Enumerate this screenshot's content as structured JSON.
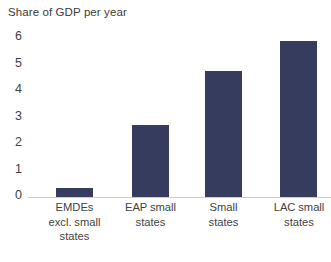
{
  "chart_data": {
    "type": "bar",
    "title": "Share of GDP per year",
    "xlabel": "",
    "ylabel": "",
    "ylim": [
      0,
      6
    ],
    "grid": false,
    "legend": false,
    "y_ticks": [
      "6",
      "5",
      "4",
      "3",
      "2",
      "1",
      "0"
    ],
    "bar_color": "#353c5e",
    "axis_color": "#c9ccd4",
    "text_color": "#3f3f3f",
    "categories": [
      "EMDEs excl. small states",
      "EAP small states",
      "Small states",
      "LAC small states"
    ],
    "category_label_lines": [
      [
        "EMDEs",
        "excl. small",
        "states"
      ],
      [
        "EAP small",
        "states"
      ],
      [
        "Small",
        "states"
      ],
      [
        "LAC small",
        "states"
      ]
    ],
    "values": [
      0.35,
      2.7,
      4.75,
      5.9
    ]
  }
}
